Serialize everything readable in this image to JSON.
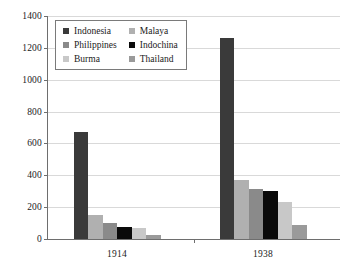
{
  "chart_data": {
    "type": "bar",
    "title": "",
    "subtitle": "",
    "xlabel": "",
    "ylabel": "",
    "categories": [
      "1914",
      "1938"
    ],
    "series": [
      {
        "name": "Indonesia",
        "color": "#3a3a3a",
        "values": [
          670,
          1260
        ]
      },
      {
        "name": "Malaya",
        "color": "#b0b0b0",
        "values": [
          150,
          370
        ]
      },
      {
        "name": "Philippines",
        "color": "#8a8a8a",
        "values": [
          100,
          315
        ]
      },
      {
        "name": "Indochina",
        "color": "#0a0a0a",
        "values": [
          75,
          300
        ]
      },
      {
        "name": "Burma",
        "color": "#c8c8c8",
        "values": [
          70,
          230
        ]
      },
      {
        "name": "Thailand",
        "color": "#9a9a9a",
        "values": [
          25,
          90
        ]
      }
    ],
    "ylim": [
      0,
      1400
    ],
    "yticks": [
      0,
      200,
      400,
      600,
      800,
      1000,
      1200,
      1400
    ],
    "ytick_labels": [
      "0",
      "200",
      "400",
      "600",
      "800",
      "1000",
      "1200",
      "1400"
    ],
    "xtick_labels": [
      "1914",
      "1938"
    ],
    "grid": true,
    "grid_axis": "y",
    "legend_position": "top-left",
    "legend_columns": 2,
    "legend_order": [
      "Indonesia",
      "Malaya",
      "Philippines",
      "Indochina",
      "Burma",
      "Thailand"
    ],
    "background_color": "#ffffff",
    "axis_color": "#6e6e6e",
    "gridline_color": "#d9d9d9"
  }
}
